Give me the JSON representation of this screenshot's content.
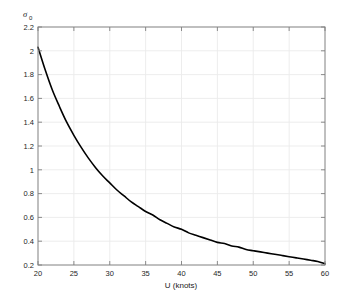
{
  "chart_data": {
    "type": "line",
    "title": "",
    "subtitle": "",
    "xlabel": "U (knots)",
    "ylabel": "σ",
    "ylabel_subscript": "0",
    "xlim": [
      20,
      60
    ],
    "ylim": [
      0.2,
      2.2
    ],
    "xticks": [
      20,
      25,
      30,
      35,
      40,
      45,
      50,
      55,
      60
    ],
    "xtick_labels": [
      "20",
      "25",
      "30",
      "35",
      "40",
      "45",
      "50",
      "55",
      "60"
    ],
    "yticks": [
      0.2,
      0.4,
      0.6,
      0.8,
      1.0,
      1.2,
      1.4,
      1.6,
      1.8,
      2.0,
      2.2
    ],
    "ytick_labels": [
      "0.2",
      "0.4",
      "0.6",
      "0.8",
      "1",
      "1.2",
      "1.4",
      "1.6",
      "1.8",
      "2",
      "2.2"
    ],
    "grid": true,
    "grid_color": "#ebebeb",
    "axis_color": "#808080",
    "legend": null,
    "legend_position": "none",
    "series": [
      {
        "name": "sigma0",
        "color": "#000000",
        "line_width": 1.6,
        "style": "solid",
        "x": [
          20,
          21,
          22,
          23,
          24,
          25,
          26,
          27,
          28,
          29,
          30,
          31,
          32,
          33,
          34,
          35,
          36,
          37,
          38,
          39,
          40,
          41,
          42,
          43,
          44,
          45,
          46,
          47,
          48,
          49,
          50,
          51,
          52,
          53,
          54,
          55,
          56,
          57,
          58,
          59,
          60
        ],
        "y": [
          2.03,
          1.84,
          1.67,
          1.53,
          1.4,
          1.29,
          1.19,
          1.1,
          1.02,
          0.95,
          0.89,
          0.83,
          0.78,
          0.73,
          0.69,
          0.65,
          0.62,
          0.58,
          0.55,
          0.52,
          0.5,
          0.47,
          0.45,
          0.43,
          0.41,
          0.39,
          0.38,
          0.36,
          0.35,
          0.33,
          0.32,
          0.31,
          0.3,
          0.29,
          0.28,
          0.27,
          0.26,
          0.25,
          0.24,
          0.23,
          0.21
        ]
      }
    ]
  },
  "figure": {
    "background_color": "#ffffff",
    "plot_background_color": "#ffffff"
  }
}
